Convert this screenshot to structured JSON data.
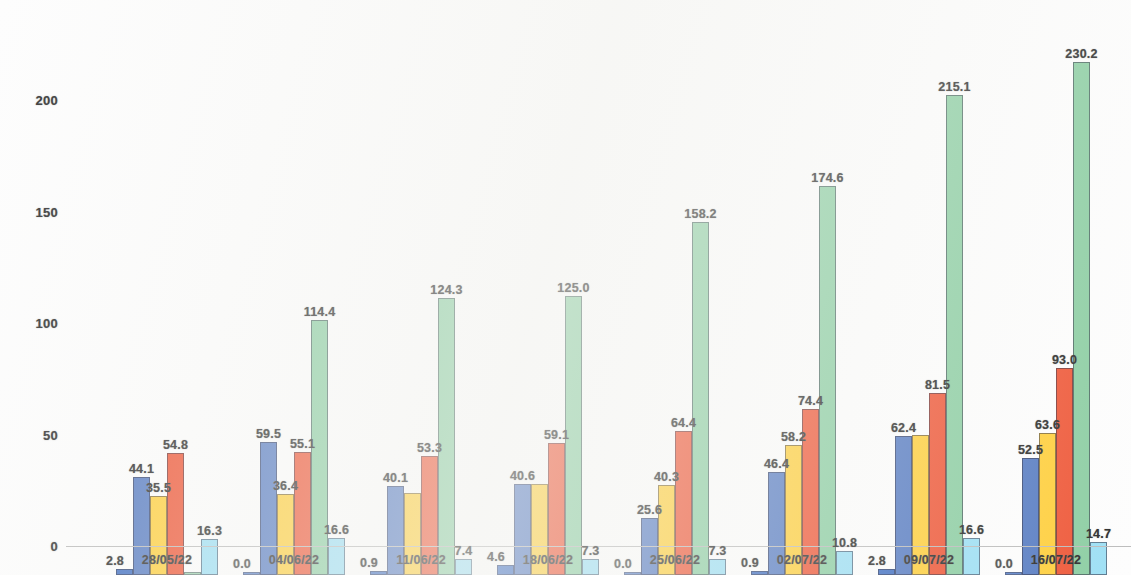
{
  "chart_data": {
    "type": "bar",
    "title": "",
    "subtitle": "",
    "xlabel": "",
    "ylabel": "",
    "grid": false,
    "legend_position": "none",
    "ylim": [
      0,
      230
    ],
    "y_ticks": [
      0,
      50,
      100,
      150,
      200
    ],
    "y_tick_labels": [
      "0",
      "50",
      "100",
      "150",
      "200"
    ],
    "categories": [
      "28/05/22",
      "04/06/22",
      "11/06/22",
      "18/06/22",
      "25/06/22",
      "02/07/22",
      "09/07/22",
      "16/07/22"
    ],
    "series": [
      {
        "name": "series-1",
        "color": "#4472c4",
        "values": [
          2.8,
          0.0,
          0.9,
          4.6,
          0.0,
          0.9,
          2.8,
          0.0
        ],
        "labels": [
          "2.8",
          "0.0",
          "0.9",
          "4.6",
          "0.0",
          "0.9",
          "2.8",
          "0.0"
        ]
      },
      {
        "name": "series-2",
        "color": "#5b7fc4",
        "values": [
          44.1,
          59.5,
          40.1,
          40.6,
          25.6,
          46.4,
          62.4,
          52.5
        ],
        "labels": [
          "44.1",
          "59.5",
          "40.1",
          "40.6",
          "25.6",
          "46.4",
          "62.4",
          "52.5"
        ]
      },
      {
        "name": "series-3",
        "color": "#ffd040",
        "values": [
          35.5,
          36.4,
          37.0,
          41.0,
          40.3,
          58.2,
          63.0,
          63.6
        ],
        "labels": [
          "35.5",
          "36.4",
          "",
          "",
          "40.3",
          "58.2",
          "",
          "63.6"
        ]
      },
      {
        "name": "series-4",
        "color": "#ef5b3c",
        "values": [
          54.8,
          55.1,
          53.3,
          59.1,
          64.4,
          74.4,
          81.5,
          93.0
        ],
        "labels": [
          "54.8",
          "55.1",
          "53.3",
          "59.1",
          "64.4",
          "74.4",
          "81.5",
          "93.0"
        ]
      },
      {
        "name": "series-5",
        "color": "#8fcfa5",
        "values": [
          0.0,
          114.4,
          124.3,
          125.0,
          158.2,
          174.6,
          215.1,
          230.2
        ],
        "labels": [
          "",
          "114.4",
          "124.3",
          "125.0",
          "158.2",
          "174.6",
          "215.1",
          "230.2"
        ]
      },
      {
        "name": "series-6",
        "color": "#9fe0f5",
        "values": [
          16.3,
          16.6,
          7.4,
          7.3,
          7.3,
          10.8,
          16.6,
          14.7
        ],
        "labels": [
          "16.3",
          "16.6",
          "7.4",
          "7.3",
          "7.3",
          "10.8",
          "16.6",
          "14.7"
        ]
      }
    ]
  },
  "axis": {
    "y_label_0": "0",
    "y_label_50": "50",
    "y_label_100": "100",
    "y_label_150": "150",
    "y_label_200": "200"
  }
}
